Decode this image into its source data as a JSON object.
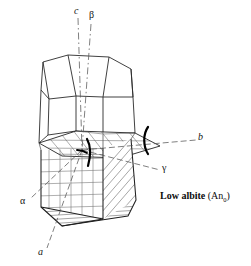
{
  "figure": {
    "caption": {
      "mineral_name": "Low albite",
      "composition_open": "(An",
      "composition_subscript": "0",
      "composition_close": ")"
    },
    "labels": {
      "c_axis": "c",
      "beta": "β",
      "b_axis": "b",
      "gamma": "γ",
      "alpha": "α",
      "a_axis": "a"
    },
    "colors": {
      "outline": "#1a1a1a",
      "hatch": "#4f4f4f",
      "grid": "#6b6b6b",
      "dashed_axis": "#5a5a5a",
      "thick_curve": "#000000",
      "background": "#ffffff"
    },
    "elements": {
      "crystal_body": "albite crystal habit outline",
      "top_plane": "horizontal 010 cleavage plane through crystal",
      "front_grid": "cross-hatched front face",
      "right_hatch": "diagonally hatched right face",
      "bottom_hatch": "hatched bottom face",
      "bracket_curve": "thick curved bracket marking b axis emergence",
      "hook_curve": "thick curved hook at plane centre"
    }
  }
}
